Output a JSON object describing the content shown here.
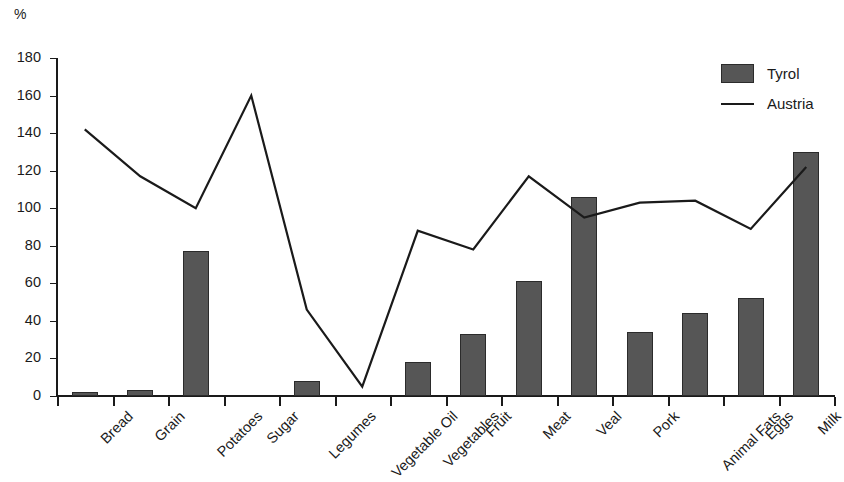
{
  "chart": {
    "unit_label": "%",
    "legend": [
      {
        "label": "Tyrol",
        "marker": "bar-swatch-icon"
      },
      {
        "label": "Austria",
        "marker": "line-swatch-icon"
      }
    ]
  },
  "chart_data": {
    "type": "bar",
    "title": "",
    "subtitle": "",
    "xlabel": "",
    "ylabel": "%",
    "ylim": [
      0,
      180
    ],
    "yticks": [
      0,
      20,
      40,
      60,
      80,
      100,
      120,
      140,
      160,
      180
    ],
    "grid": false,
    "legend_position": "top-right",
    "categories": [
      "Bread",
      "Grain",
      "Potatoes",
      "Sugar",
      "Legumes",
      "Vegetable Oil",
      "Vegetables",
      "Fruit",
      "Meat",
      "Veal",
      "Pork",
      "Animal Fats",
      "Eggs",
      "Milk"
    ],
    "series": [
      {
        "name": "Tyrol",
        "type": "bar",
        "color": "#565656",
        "values": [
          2,
          3,
          77,
          0,
          8,
          0,
          18,
          33,
          61,
          106,
          34,
          44,
          52,
          130
        ]
      },
      {
        "name": "Austria",
        "type": "line",
        "color": "#1a1a1a",
        "values": [
          142,
          117,
          100,
          160,
          46,
          5,
          88,
          78,
          117,
          95,
          103,
          104,
          89,
          122
        ]
      }
    ]
  }
}
